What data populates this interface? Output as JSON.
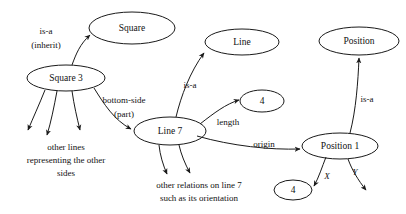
{
  "diagram": {
    "background_color": "#ffffff",
    "stroke_color": "#1a1a1a",
    "text_color": "#111111",
    "nodes": [
      {
        "id": "square",
        "label": "Square",
        "cx": 132,
        "cy": 28,
        "rx": 43,
        "ry": 16
      },
      {
        "id": "square3",
        "label": "Square 3",
        "cx": 66,
        "cy": 78,
        "rx": 39,
        "ry": 13
      },
      {
        "id": "line",
        "label": "Line",
        "cx": 242,
        "cy": 42,
        "rx": 37,
        "ry": 13
      },
      {
        "id": "position",
        "label": "Position",
        "cx": 359,
        "cy": 41,
        "rx": 40,
        "ry": 14
      },
      {
        "id": "line7",
        "label": "Line 7",
        "cx": 170,
        "cy": 131,
        "rx": 36,
        "ry": 14
      },
      {
        "id": "four_len",
        "label": "4",
        "cx": 262,
        "cy": 101,
        "rx": 22,
        "ry": 11
      },
      {
        "id": "position1",
        "label": "Position 1",
        "cx": 340,
        "cy": 146,
        "rx": 38,
        "ry": 13
      },
      {
        "id": "four_x",
        "label": "4",
        "cx": 293,
        "cy": 190,
        "rx": 19,
        "ry": 10
      }
    ],
    "edge_labels": [
      {
        "id": "isa-inherit-1",
        "text": "is-a",
        "x": 46,
        "y": 32,
        "italic": false
      },
      {
        "id": "isa-inherit-2",
        "text": "(inherit)",
        "x": 46,
        "y": 46,
        "italic": false
      },
      {
        "id": "bottom-side-1",
        "text": "bottom-side",
        "x": 124,
        "y": 101,
        "italic": false
      },
      {
        "id": "bottom-side-2",
        "text": "(part)",
        "x": 124,
        "y": 115,
        "italic": false
      },
      {
        "id": "isa-line",
        "text": "is-a",
        "x": 190,
        "y": 86,
        "italic": false
      },
      {
        "id": "length",
        "text": "length",
        "x": 228,
        "y": 123,
        "italic": false
      },
      {
        "id": "origin",
        "text": "origin",
        "x": 264,
        "y": 145,
        "italic": false
      },
      {
        "id": "isa-position",
        "text": "is-a",
        "x": 367,
        "y": 100,
        "italic": false
      },
      {
        "id": "x-label",
        "text": "X",
        "x": 327,
        "y": 177,
        "italic": true
      },
      {
        "id": "y-label",
        "text": "Y",
        "x": 355,
        "y": 173,
        "italic": true
      }
    ],
    "notes": [
      {
        "id": "other-lines-note",
        "lines": [
          "other lines",
          "representing the other",
          "sides"
        ],
        "x": 66,
        "y": 148,
        "line_height": 13
      },
      {
        "id": "other-relations-note",
        "lines": [
          "other relations on line 7",
          "such as its orientation"
        ],
        "x": 199,
        "y": 186,
        "line_height": 13
      }
    ],
    "edges": [
      {
        "id": "edge-square3-to-square",
        "from": "square3",
        "to": "square",
        "label": "is-a (inherit)"
      },
      {
        "id": "edge-square3-to-line7",
        "from": "square3",
        "to": "line7",
        "label": "bottom-side (part)"
      },
      {
        "id": "edge-square3-other-1",
        "from": "square3",
        "to": "other-lines-note",
        "label": ""
      },
      {
        "id": "edge-square3-other-2",
        "from": "square3",
        "to": "other-lines-note",
        "label": ""
      },
      {
        "id": "edge-square3-other-3",
        "from": "square3",
        "to": "other-lines-note",
        "label": ""
      },
      {
        "id": "edge-line7-to-line",
        "from": "line7",
        "to": "line",
        "label": "is-a"
      },
      {
        "id": "edge-line7-to-four",
        "from": "line7",
        "to": "four_len",
        "label": "length"
      },
      {
        "id": "edge-line7-to-position1",
        "from": "line7",
        "to": "position1",
        "label": "origin"
      },
      {
        "id": "edge-line7-other-1",
        "from": "line7",
        "to": "other-relations-note",
        "label": ""
      },
      {
        "id": "edge-line7-other-2",
        "from": "line7",
        "to": "other-relations-note",
        "label": ""
      },
      {
        "id": "edge-position1-to-position",
        "from": "position1",
        "to": "position",
        "label": "is-a"
      },
      {
        "id": "edge-position1-to-four-x",
        "from": "position1",
        "to": "four_x",
        "label": "X"
      },
      {
        "id": "edge-position1-y",
        "from": "position1",
        "to": "",
        "label": "Y"
      }
    ]
  }
}
